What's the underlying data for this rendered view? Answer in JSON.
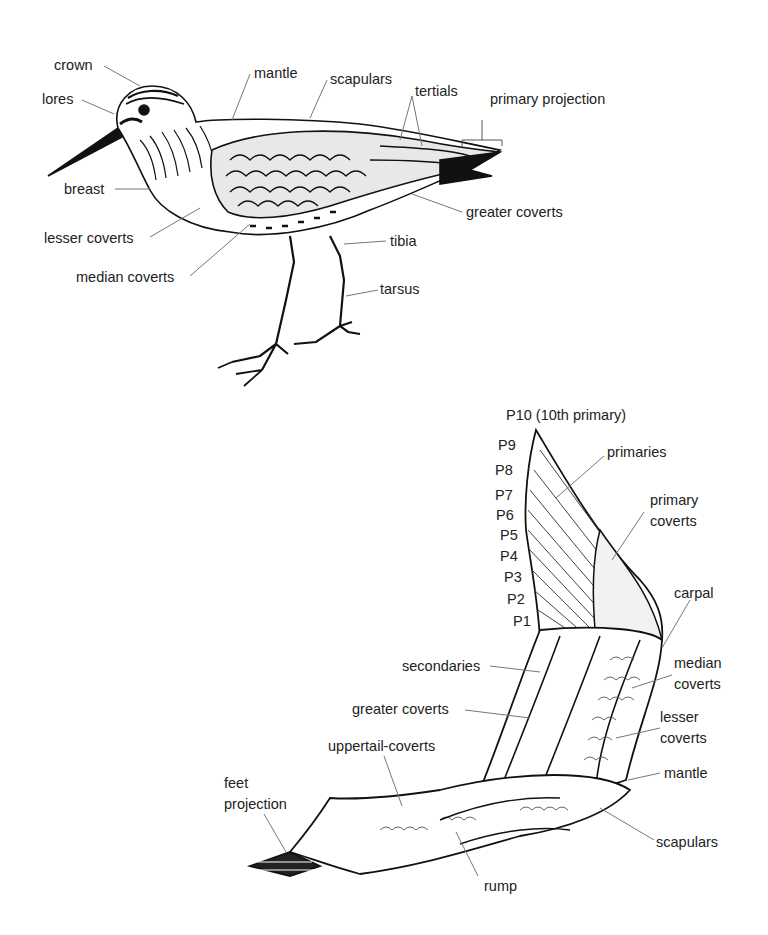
{
  "standing_bird": {
    "labels": {
      "crown": "crown",
      "lores": "lores",
      "breast": "breast",
      "lesser_coverts": "lesser coverts",
      "median_coverts": "median coverts",
      "mantle": "mantle",
      "scapulars": "scapulars",
      "tertials": "tertials",
      "primary_projection": "primary projection",
      "greater_coverts": "greater coverts",
      "tibia": "tibia",
      "tarsus": "tarsus"
    }
  },
  "flying_bird": {
    "primaries_list": [
      "P10 (10th primary)",
      "P9",
      "P8",
      "P7",
      "P6",
      "P5",
      "P4",
      "P3",
      "P2",
      "P1"
    ],
    "labels": {
      "primaries": "primaries",
      "primary_coverts_1": "primary",
      "primary_coverts_2": "coverts",
      "carpal": "carpal",
      "median_coverts_1": "median",
      "median_coverts_2": "coverts",
      "lesser_coverts_1": "lesser",
      "lesser_coverts_2": "coverts",
      "mantle": "mantle",
      "scapulars": "scapulars",
      "secondaries": "secondaries",
      "greater_coverts": "greater coverts",
      "uppertail_coverts": "uppertail-coverts",
      "feet_projection_1": "feet",
      "feet_projection_2": "projection",
      "rump": "rump"
    }
  }
}
